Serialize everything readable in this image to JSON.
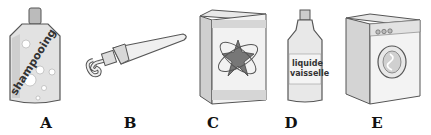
{
  "figure": {
    "items": [
      {
        "letter": "A",
        "name": "shampoo bottle",
        "text": "shampooing"
      },
      {
        "letter": "B",
        "name": "toothpaste tube",
        "text": ""
      },
      {
        "letter": "C",
        "name": "detergent box",
        "text": ""
      },
      {
        "letter": "D",
        "name": "dish soap bottle",
        "text_line1": "liquide",
        "text_line2": "vaisselle"
      },
      {
        "letter": "E",
        "name": "washing machine",
        "text": ""
      }
    ],
    "colors": {
      "outline": "#555555",
      "fill_light": "#e4e4e4",
      "fill_mid": "#c8c8c8",
      "fill_dark": "#777777"
    }
  }
}
